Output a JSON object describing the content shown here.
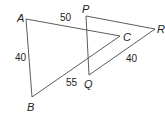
{
  "diagram": {
    "title": "",
    "stroke_color": "#4a4a4a",
    "triangles": [
      {
        "name": "ABC",
        "vertices": [
          {
            "label": "A",
            "x": 26,
            "y": 19,
            "label_x": 17,
            "label_y": 22
          },
          {
            "label": "B",
            "x": 32,
            "y": 97,
            "label_x": 27,
            "label_y": 111
          },
          {
            "label": "C",
            "x": 120,
            "y": 36,
            "label_x": 123,
            "label_y": 41
          }
        ],
        "sides": [
          {
            "from": "A",
            "to": "C",
            "length": "50",
            "label_x": 60,
            "label_y": 21
          },
          {
            "from": "A",
            "to": "B",
            "length": "40",
            "label_x": 15,
            "label_y": 61
          },
          {
            "from": "B",
            "to": "C",
            "length": "55",
            "label_x": 66,
            "label_y": 86
          }
        ]
      },
      {
        "name": "PQR",
        "vertices": [
          {
            "label": "P",
            "x": 86,
            "y": 16,
            "label_x": 82,
            "label_y": 13
          },
          {
            "label": "Q",
            "x": 89,
            "y": 75,
            "label_x": 84,
            "label_y": 88
          },
          {
            "label": "R",
            "x": 155,
            "y": 29,
            "label_x": 157,
            "label_y": 33
          }
        ],
        "sides": [
          {
            "from": "Q",
            "to": "R",
            "length": "40",
            "label_x": 126,
            "label_y": 62
          }
        ]
      }
    ]
  }
}
